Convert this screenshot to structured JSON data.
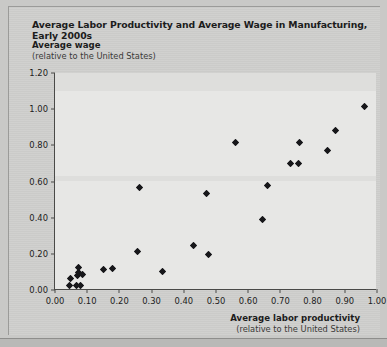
{
  "chart_data": {
    "type": "scatter",
    "title": "Average Labor Productivity and Average Wage in Manufacturing, Early 2000s",
    "ylabel_line1": "Average wage",
    "ylabel_line2": "(relative to the United States)",
    "xlabel_line1": "Average labor productivity",
    "xlabel_line2": "(relative to the United States)",
    "xlim": [
      0.0,
      1.0
    ],
    "ylim": [
      0.0,
      1.2
    ],
    "grid": false,
    "legend": null,
    "xticks": [
      "0.00",
      "0.10",
      "0.20",
      "0.30",
      "0.40",
      "0.50",
      "0.60",
      "0.70",
      "0.80",
      "0.90",
      "1.00"
    ],
    "xtick_values": [
      0.0,
      0.1,
      0.2,
      0.3,
      0.4,
      0.5,
      0.6,
      0.7,
      0.8,
      0.9,
      1.0
    ],
    "yticks": [
      "0.00",
      "0.20",
      "0.40",
      "0.60",
      "0.80",
      "1.00",
      "1.20"
    ],
    "ytick_values": [
      0.0,
      0.2,
      0.4,
      0.6,
      0.8,
      1.0,
      1.2
    ],
    "marker": "diamond",
    "marker_color": "#17171a",
    "points": [
      {
        "x": 0.045,
        "y": 0.025
      },
      {
        "x": 0.048,
        "y": 0.065
      },
      {
        "x": 0.068,
        "y": 0.025
      },
      {
        "x": 0.078,
        "y": 0.025
      },
      {
        "x": 0.07,
        "y": 0.08
      },
      {
        "x": 0.072,
        "y": 0.095
      },
      {
        "x": 0.074,
        "y": 0.125
      },
      {
        "x": 0.086,
        "y": 0.085
      },
      {
        "x": 0.15,
        "y": 0.115
      },
      {
        "x": 0.18,
        "y": 0.118
      },
      {
        "x": 0.262,
        "y": 0.565
      },
      {
        "x": 0.255,
        "y": 0.215
      },
      {
        "x": 0.335,
        "y": 0.1
      },
      {
        "x": 0.43,
        "y": 0.245
      },
      {
        "x": 0.47,
        "y": 0.535
      },
      {
        "x": 0.478,
        "y": 0.195
      },
      {
        "x": 0.56,
        "y": 0.815
      },
      {
        "x": 0.645,
        "y": 0.39
      },
      {
        "x": 0.66,
        "y": 0.58
      },
      {
        "x": 0.73,
        "y": 0.7
      },
      {
        "x": 0.755,
        "y": 0.7
      },
      {
        "x": 0.76,
        "y": 0.815
      },
      {
        "x": 0.845,
        "y": 0.77
      },
      {
        "x": 0.87,
        "y": 0.88
      },
      {
        "x": 0.96,
        "y": 1.015
      }
    ]
  }
}
